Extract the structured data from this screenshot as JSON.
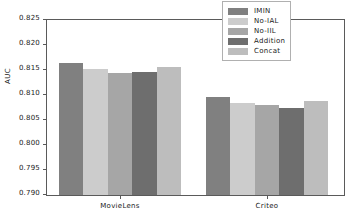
{
  "chart_data": {
    "type": "bar",
    "title": "",
    "xlabel": "",
    "ylabel": "AUC",
    "ylim": [
      0.79,
      0.825
    ],
    "yticks": [
      "0.825",
      "0.820",
      "0.815",
      "0.810",
      "0.805",
      "0.800",
      "0.795",
      "0.790"
    ],
    "ytick_values": [
      0.825,
      0.82,
      0.815,
      0.81,
      0.805,
      0.8,
      0.795,
      0.79
    ],
    "grid": false,
    "legend_position": "upper right",
    "categories": [
      "MovieLens",
      "Criteo"
    ],
    "series": [
      {
        "name": "IMIN",
        "color": "#808080",
        "values": [
          0.8165,
          0.8097
        ]
      },
      {
        "name": "No-IAL",
        "color": "#cccccc",
        "values": [
          0.8152,
          0.8085
        ]
      },
      {
        "name": "No-IIL",
        "color": "#a6a6a6",
        "values": [
          0.8145,
          0.808
        ]
      },
      {
        "name": "Addition",
        "color": "#6e6e6e",
        "values": [
          0.8147,
          0.8075
        ]
      },
      {
        "name": "Concat",
        "color": "#bdbdbd",
        "values": [
          0.8157,
          0.8088
        ]
      }
    ]
  },
  "legend": {
    "items": [
      {
        "label": "IMIN"
      },
      {
        "label": "No-IAL"
      },
      {
        "label": "No-IIL"
      },
      {
        "label": "Addition"
      },
      {
        "label": "Concat"
      }
    ]
  }
}
